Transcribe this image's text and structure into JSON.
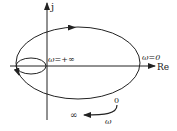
{
  "diagram": {
    "type": "nyquist-plot",
    "axes": {
      "vertical_label": "j",
      "horizontal_label": "Re"
    },
    "labels": {
      "omega_inf": "ω=+∞",
      "omega_zero": "ω=0"
    },
    "legend": {
      "start": "0",
      "end": "∞",
      "variable": "ω"
    },
    "colors": {
      "stroke": "#222222",
      "background": "#ffffff"
    }
  }
}
